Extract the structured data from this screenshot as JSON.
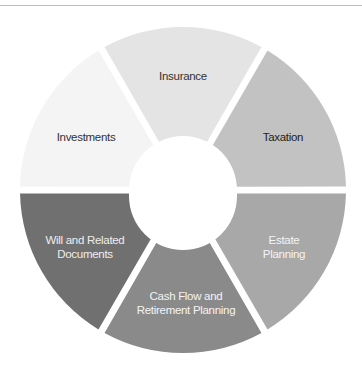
{
  "diagram": {
    "type": "segmented-ring",
    "center": {
      "x": 183,
      "y": 190
    },
    "outer_radius": 163,
    "inner_radius": 54,
    "gap": 7,
    "segments": [
      {
        "id": "insurance",
        "label_lines": [
          "Insurance"
        ],
        "fill": "#e4e4e4",
        "text_color": "#333333",
        "start_deg": 240,
        "end_deg": 300
      },
      {
        "id": "taxation",
        "label_lines": [
          "Taxation"
        ],
        "fill": "#c2c2c2",
        "text_color": "#222222",
        "start_deg": 300,
        "end_deg": 360
      },
      {
        "id": "estate-planning",
        "label_lines": [
          "Estate",
          "Planning"
        ],
        "fill": "#a8a8a8",
        "text_color": "#f2f2f2",
        "start_deg": 0,
        "end_deg": 60
      },
      {
        "id": "cash-flow-retirement-planning",
        "label_lines": [
          "Cash Flow and",
          "Retirement Planning"
        ],
        "fill": "#8a8a8a",
        "text_color": "#f2f2f2",
        "start_deg": 60,
        "end_deg": 120
      },
      {
        "id": "will-related-documents",
        "label_lines": [
          "Will and Related",
          "Documents"
        ],
        "fill": "#707070",
        "text_color": "#eeeeee",
        "start_deg": 120,
        "end_deg": 180
      },
      {
        "id": "investments",
        "label_lines": [
          "Investments"
        ],
        "fill": "#f4f4f4",
        "text_color": "#333333",
        "start_deg": 180,
        "end_deg": 240
      }
    ]
  },
  "labels": {
    "insurance": "Insurance",
    "taxation": "Taxation",
    "estate_1": "Estate",
    "estate_2": "Planning",
    "cash_1": "Cash Flow and",
    "cash_2": "Retirement Planning",
    "will_1": "Will and Related",
    "will_2": "Documents",
    "investments": "Investments"
  }
}
